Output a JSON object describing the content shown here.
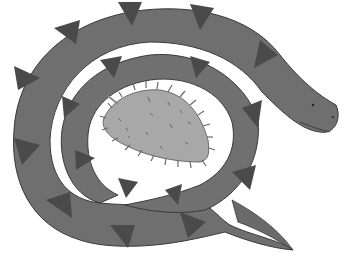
{
  "image": {
    "description": "Hand-drawn grayscale illustration of a coiled snake with darker triangular markings, wrapped around a spiky leaf-shaped seed pod",
    "subjects": [
      "snake",
      "spiky-seed-pod"
    ],
    "colors": {
      "background": "#ffffff",
      "snake_body": "#6f6f6f",
      "snake_markings": "#4a4a4a",
      "seed_pod": "#a8a8a8",
      "outline": "#3a3a3a"
    }
  }
}
